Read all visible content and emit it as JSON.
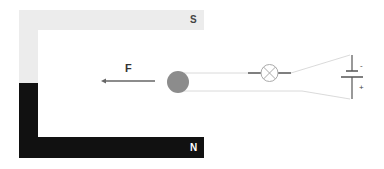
{
  "diagram": {
    "title": "",
    "magnet": {
      "south_label": "S",
      "north_label": "N",
      "south_color": "#ececec",
      "north_color": "#111111"
    },
    "force": {
      "label": "F",
      "direction": "left",
      "color": "#666666"
    },
    "conductor": {
      "shape": "circle",
      "color": "#8c8c8c"
    },
    "circuit": {
      "lamp": "lamp-symbol",
      "battery": {
        "negative_label": "-",
        "positive_label": "+"
      },
      "wire_color": "#cccccc"
    }
  }
}
